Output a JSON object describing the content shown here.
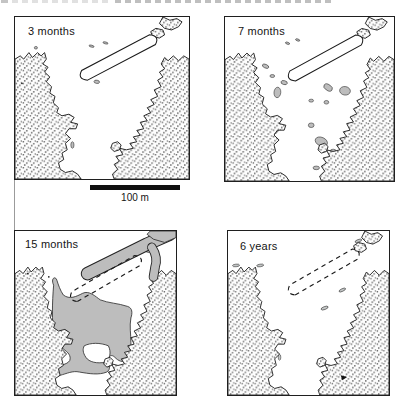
{
  "figure": {
    "panels": [
      {
        "label": "3 months"
      },
      {
        "label": "7 months"
      },
      {
        "label": "15 months"
      },
      {
        "label": "6 years"
      }
    ],
    "scale_bar_label": "100 m"
  },
  "colors": {
    "ink": "#1a1a1a",
    "oil_patch_gray": "#bdbdbd",
    "land_stipple_dot": "#5e5e5e",
    "paper": "#ffffff"
  }
}
